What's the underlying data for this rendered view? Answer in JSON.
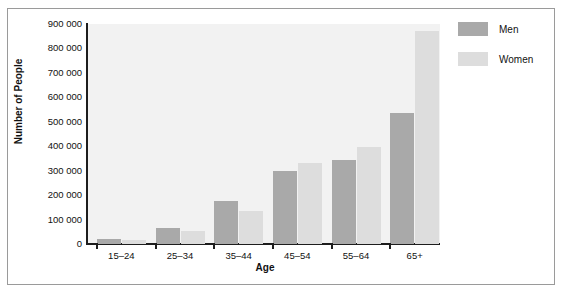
{
  "chart_data": {
    "type": "bar",
    "title": "",
    "xlabel": "Age",
    "ylabel": "Number of People",
    "categories": [
      "15–24",
      "25–34",
      "35–44",
      "45–54",
      "55–64",
      "65+"
    ],
    "series": [
      {
        "name": "Men",
        "values": [
          20000,
          65000,
          175000,
          300000,
          345000,
          535000
        ],
        "color": "#a9a9a9"
      },
      {
        "name": "Women",
        "values": [
          18000,
          55000,
          135000,
          330000,
          395000,
          870000
        ],
        "color": "#dddddd"
      }
    ],
    "ylim": [
      0,
      900000
    ],
    "ytick_values": [
      0,
      100000,
      200000,
      300000,
      400000,
      500000,
      600000,
      700000,
      800000,
      900000
    ],
    "ytick_labels": [
      "0",
      "100 000",
      "200 000",
      "300 000",
      "400 000",
      "500 000",
      "600 000",
      "700 000",
      "800 000",
      "900 000"
    ],
    "grid": false,
    "legend_position": "right-top",
    "plot_background": "#f2f2f2",
    "axis_color": "#1d1d1d",
    "frame_color": "#9a9a9a"
  },
  "legend": {
    "entries": [
      {
        "label": "Men",
        "color": "#a9a9a9"
      },
      {
        "label": "Women",
        "color": "#dddddd"
      }
    ]
  }
}
